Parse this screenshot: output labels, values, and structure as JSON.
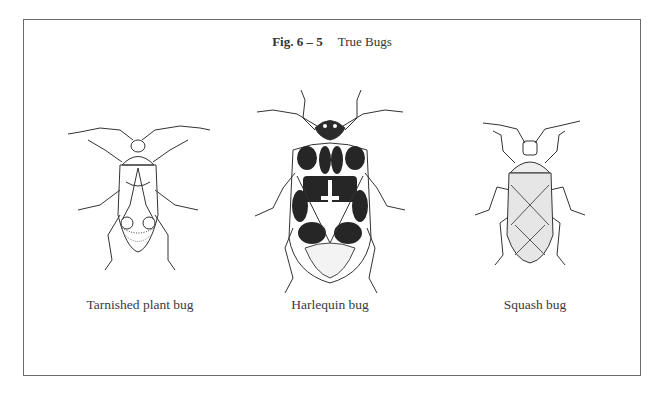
{
  "figure": {
    "number": "Fig. 6 – 5",
    "title": "True Bugs",
    "border_color": "#6b6b6b",
    "illustrations": [
      {
        "name": "tarnished-plant-bug",
        "caption": "Tarnished plant bug"
      },
      {
        "name": "harlequin-bug",
        "caption": "Harlequin bug"
      },
      {
        "name": "squash-bug",
        "caption": "Squash bug"
      }
    ]
  }
}
